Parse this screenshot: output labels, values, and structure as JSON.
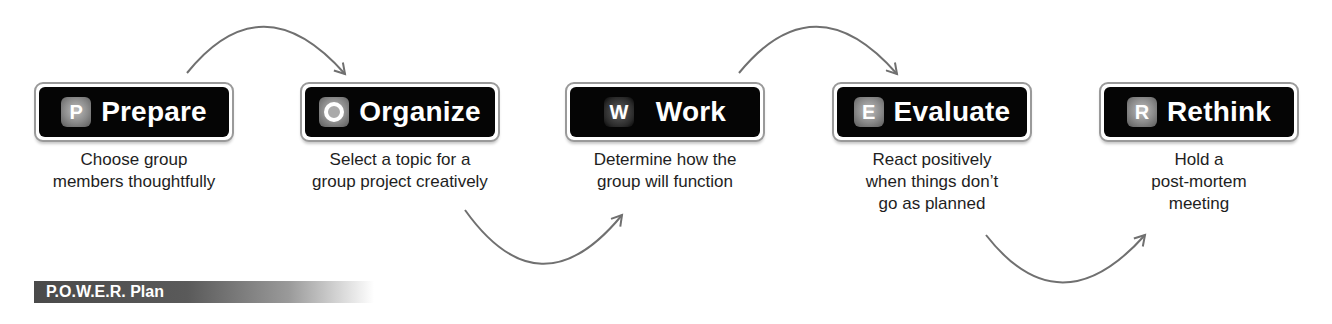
{
  "diagram": {
    "title": "P.O.W.E.R. Plan",
    "steps": [
      {
        "letter": "P",
        "label": "Prepare",
        "description": [
          "Choose group",
          "members thoughtfully"
        ]
      },
      {
        "letter": "O",
        "label": "Organize",
        "description": [
          "Select a topic for a",
          "group project creatively"
        ]
      },
      {
        "letter": "W",
        "label": "Work",
        "description": [
          "Determine how the",
          "group will function"
        ]
      },
      {
        "letter": "E",
        "label": "Evaluate",
        "description": [
          "React positively",
          "when things don’t",
          "go as planned"
        ]
      },
      {
        "letter": "R",
        "label": "Rethink",
        "description": [
          "Hold a",
          "post-mortem",
          "meeting"
        ]
      }
    ],
    "connectors": [
      {
        "from": "Prepare",
        "to": "Organize",
        "position": "above"
      },
      {
        "from": "Organize",
        "to": "Work",
        "position": "below"
      },
      {
        "from": "Work",
        "to": "Evaluate",
        "position": "above"
      },
      {
        "from": "Evaluate",
        "to": "Rethink",
        "position": "below"
      }
    ],
    "colors": {
      "box": "#050505",
      "badge": "#8a8a8a",
      "arrow": "#707070",
      "banner": "#4a4a4a"
    }
  }
}
